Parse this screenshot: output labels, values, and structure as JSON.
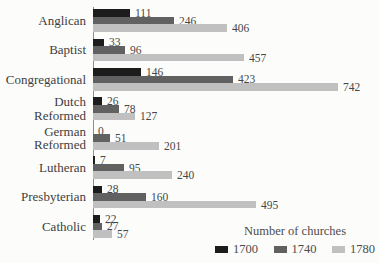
{
  "chart_data": {
    "type": "bar",
    "orientation": "horizontal",
    "legend_title": "Number of churches",
    "legend_position": "bottom-right",
    "grid": false,
    "value_labels_shown": true,
    "xlim": [
      0,
      760
    ],
    "categories": [
      "Anglican",
      "Baptist",
      "Congregational",
      "Dutch Reformed",
      "German Reformed",
      "Lutheran",
      "Presbyterian",
      "Catholic"
    ],
    "series": [
      {
        "name": "1700",
        "color": "#1c1c1c",
        "values": [
          111,
          33,
          146,
          26,
          0,
          7,
          28,
          22
        ]
      },
      {
        "name": "1740",
        "color": "#616161",
        "values": [
          246,
          96,
          423,
          78,
          51,
          95,
          160,
          27
        ]
      },
      {
        "name": "1780",
        "color": "#c0c0c0",
        "values": [
          406,
          457,
          742,
          127,
          201,
          240,
          495,
          57
        ]
      }
    ],
    "axis_color": "#8f8f8f",
    "text_color": "#3e3e3e"
  }
}
